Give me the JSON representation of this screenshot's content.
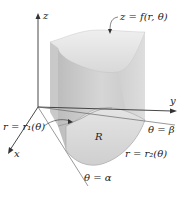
{
  "figure": {
    "type": "3D solid over polar region",
    "axes": {
      "z_label": "z",
      "y_label": "y",
      "x_label": "x"
    },
    "surface_label": "z = f(r, θ)",
    "region_label": "R",
    "boundaries": {
      "inner_curve": "r = r₁(θ)",
      "outer_curve": "r = r₂(θ)",
      "ray_alpha": "θ = α",
      "ray_beta": "θ = β"
    },
    "colors": {
      "solid_front": "#c8c8c8",
      "solid_side": "#dcdcdc",
      "solid_top": "#e6e6e6",
      "region_fill": "#d9d9d9",
      "axis": "#333333"
    }
  }
}
